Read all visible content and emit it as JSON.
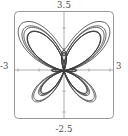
{
  "chart_data": {
    "type": "line",
    "title": "",
    "subtitle": "",
    "xlabel": "",
    "ylabel": "",
    "legend": [],
    "grid": false,
    "frame": true,
    "frame_rounded": true,
    "axes_cross_at_origin": true,
    "xlim": [
      -3,
      3
    ],
    "ylim": [
      -2.5,
      3.5
    ],
    "x_tick_labels": [
      "-3",
      "3"
    ],
    "y_tick_labels": [
      "-2.5",
      "3.5"
    ],
    "x_ticks": [
      -3,
      -1.5,
      1.5,
      3
    ],
    "y_ticks": [
      -2.5,
      -1.25,
      1.25,
      3.5
    ],
    "curve_description": "butterfly-like polar rose curve with two large upper lobes, two large lower lobes, one narrow vertical upper lobe and two flat horizontal lobes",
    "series": [
      {
        "name": "polar-curve",
        "color": "#3c3c3c",
        "closed": true,
        "points_xy": [
          [
            0.0,
            0.0
          ],
          [
            0.197,
            0.022
          ],
          [
            0.418,
            0.055
          ],
          [
            0.672,
            0.107
          ],
          [
            0.955,
            0.186
          ],
          [
            1.253,
            0.298
          ],
          [
            1.545,
            0.448
          ],
          [
            1.806,
            0.637
          ],
          [
            2.016,
            0.862
          ],
          [
            2.158,
            1.114
          ],
          [
            2.227,
            1.384
          ],
          [
            2.222,
            1.657
          ],
          [
            2.148,
            1.919
          ],
          [
            2.014,
            2.154
          ],
          [
            1.834,
            2.349
          ],
          [
            1.62,
            2.492
          ],
          [
            1.386,
            2.578
          ],
          [
            1.147,
            2.601
          ],
          [
            0.914,
            2.563
          ],
          [
            0.699,
            2.467
          ],
          [
            0.51,
            2.32
          ],
          [
            0.353,
            2.131
          ],
          [
            0.232,
            1.91
          ],
          [
            0.148,
            1.669
          ],
          [
            0.098,
            1.418
          ],
          [
            0.079,
            1.167
          ],
          [
            0.116,
            0.93
          ],
          [
            0.186,
            0.828
          ],
          [
            0.272,
            0.9
          ],
          [
            0.329,
            1.096
          ],
          [
            0.344,
            1.33
          ],
          [
            0.317,
            1.557
          ],
          [
            0.253,
            1.742
          ],
          [
            0.161,
            1.864
          ],
          [
            0.055,
            1.909
          ],
          [
            -0.055,
            1.878
          ],
          [
            -0.157,
            1.774
          ],
          [
            -0.245,
            1.605
          ],
          [
            -0.311,
            1.385
          ],
          [
            -0.349,
            1.13
          ],
          [
            -0.353,
            0.86
          ],
          [
            -0.321,
            0.597
          ],
          [
            -0.256,
            0.36
          ],
          [
            -0.164,
            0.168
          ],
          [
            -0.056,
            0.034
          ],
          [
            -0.12,
            0.011
          ],
          [
            -0.34,
            0.03
          ],
          [
            -0.62,
            0.081
          ],
          [
            -0.93,
            0.15
          ],
          [
            -1.24,
            0.217
          ],
          [
            -1.52,
            0.262
          ],
          [
            -1.74,
            0.268
          ],
          [
            -1.87,
            0.226
          ],
          [
            -1.9,
            0.137
          ],
          [
            -1.82,
            0.018
          ],
          [
            -1.64,
            -0.108
          ],
          [
            -1.39,
            -0.208
          ],
          [
            -1.1,
            -0.258
          ],
          [
            -0.81,
            -0.247
          ],
          [
            -0.55,
            -0.182
          ],
          [
            -0.34,
            -0.085
          ],
          [
            -0.19,
            -0.013
          ],
          [
            -0.34,
            -0.06
          ],
          [
            -0.6,
            -0.21
          ],
          [
            -0.88,
            -0.46
          ],
          [
            -1.14,
            -0.79
          ],
          [
            -1.34,
            -1.16
          ],
          [
            -1.45,
            -1.53
          ],
          [
            -1.45,
            -1.86
          ],
          [
            -1.34,
            -2.11
          ],
          [
            -1.14,
            -2.26
          ],
          [
            -0.89,
            -2.3
          ],
          [
            -0.64,
            -2.23
          ],
          [
            -0.42,
            -2.06
          ],
          [
            -0.25,
            -1.81
          ],
          [
            -0.13,
            -1.51
          ],
          [
            -0.06,
            -1.19
          ],
          [
            -0.02,
            -0.88
          ],
          [
            -0.005,
            -0.6
          ],
          [
            0.0,
            -0.36
          ],
          [
            0.02,
            -0.18
          ],
          [
            0.06,
            -0.37
          ],
          [
            0.13,
            -0.66
          ],
          [
            0.25,
            -1.02
          ],
          [
            0.42,
            -1.4
          ],
          [
            0.64,
            -1.75
          ],
          [
            0.89,
            -2.03
          ],
          [
            1.14,
            -2.2
          ],
          [
            1.34,
            -2.24
          ],
          [
            1.45,
            -2.14
          ],
          [
            1.45,
            -1.92
          ],
          [
            1.34,
            -1.62
          ],
          [
            1.14,
            -1.28
          ],
          [
            0.88,
            -0.94
          ],
          [
            0.6,
            -0.64
          ],
          [
            0.34,
            -0.39
          ],
          [
            0.15,
            -0.19
          ],
          [
            0.31,
            -0.23
          ],
          [
            0.57,
            -0.25
          ],
          [
            0.87,
            -0.25
          ],
          [
            1.16,
            -0.22
          ],
          [
            1.42,
            -0.16
          ],
          [
            1.64,
            -0.07
          ],
          [
            1.79,
            0.04
          ],
          [
            1.85,
            0.15
          ],
          [
            1.8,
            0.24
          ],
          [
            1.65,
            0.29
          ],
          [
            1.42,
            0.29
          ],
          [
            1.14,
            0.25
          ],
          [
            0.85,
            0.18
          ],
          [
            0.56,
            0.1
          ],
          [
            0.3,
            0.03
          ],
          [
            0.1,
            0.005
          ],
          [
            0.0,
            0.0
          ]
        ]
      },
      {
        "name": "polar-curve-mirror",
        "color": "#3c3c3c",
        "closed": true,
        "points_xy": []
      }
    ],
    "style": {
      "curve_color": "#3c3c3c",
      "curve_width": 0.8,
      "frame_color": "#8c8c8c",
      "axis_color": "#9a9a9a",
      "tick_color": "#9a9a9a",
      "label_color": "#4a4a4a",
      "background": "#ffffff"
    }
  },
  "labels": {
    "top": "3.5",
    "bottom": "-2.5",
    "left": "-3",
    "right": "3"
  },
  "geometry": {
    "frame_left": 14,
    "frame_top": 11,
    "frame_right": 114,
    "frame_bottom": 119,
    "origin_x": 64,
    "origin_y": 70,
    "unit_x": 16.6,
    "unit_y": 16.6,
    "corner_radius": 4
  }
}
